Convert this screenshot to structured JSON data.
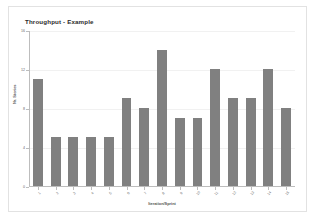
{
  "chart_data": {
    "type": "bar",
    "title": "Throughput - Example",
    "xlabel": "Iteration/Sprint",
    "ylabel": "Nr. Stories",
    "categories": [
      "1",
      "2",
      "3",
      "4",
      "5",
      "6",
      "7",
      "8",
      "9",
      "10",
      "11",
      "12",
      "13",
      "14",
      "15"
    ],
    "values": [
      11,
      5,
      5,
      5,
      5,
      9,
      8,
      14,
      7,
      7,
      12,
      9,
      9,
      12,
      8
    ],
    "ylim": [
      0,
      16
    ],
    "yticks": [
      "0",
      "4",
      "8",
      "12",
      "16"
    ],
    "ytick_values": [
      0,
      4,
      8,
      12,
      16
    ],
    "grid": false,
    "legend": false,
    "series": [
      {
        "name": "Throughput",
        "color": "#808080",
        "values": [
          11,
          5,
          5,
          5,
          5,
          9,
          8,
          14,
          7,
          7,
          12,
          9,
          9,
          12,
          8
        ]
      }
    ]
  },
  "colors": {
    "bar": "#808080",
    "axis": "#bdbdbd",
    "frame": "#e2e2e2",
    "title_text": "#2a2a2a",
    "tick_text": "#666666",
    "axis_title_text": "#555555",
    "background": "#ffffff"
  }
}
